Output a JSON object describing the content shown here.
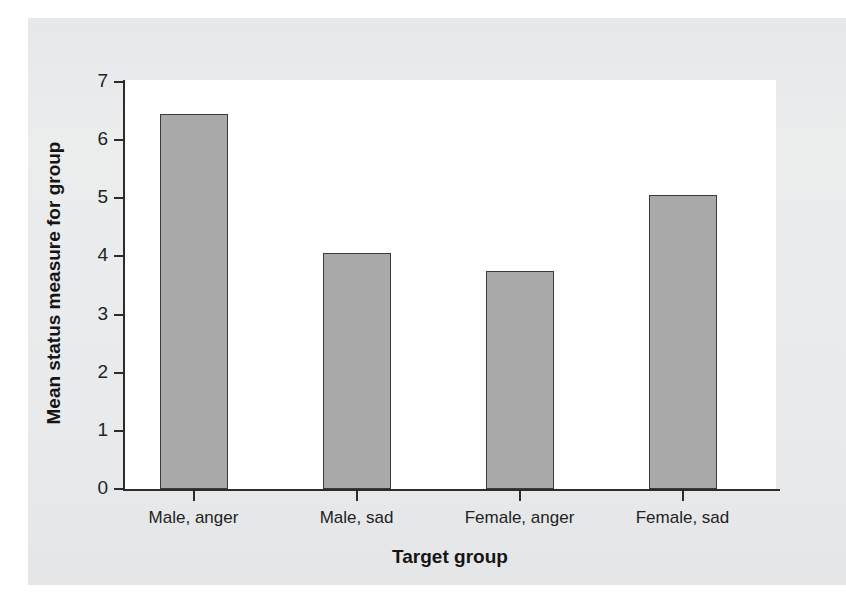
{
  "figure": {
    "background_color": "#e9eaec",
    "plot_background_color": "#ffffff",
    "bar_fill_color": "#a9a9a9",
    "bar_edge_color": "#3a3a3a",
    "axis_color": "#2c2c2c"
  },
  "chart_data": {
    "type": "bar",
    "title": "",
    "xlabel": "Target group",
    "ylabel": "Mean status measure for group",
    "categories": [
      "Male, anger",
      "Male, sad",
      "Female, anger",
      "Female, sad"
    ],
    "values": [
      6.45,
      4.06,
      3.75,
      5.06
    ],
    "ylim": [
      0,
      7
    ],
    "yticks": [
      "0",
      "1",
      "2",
      "3",
      "4",
      "5",
      "6",
      "7"
    ],
    "ytick_values": [
      0,
      1,
      2,
      3,
      4,
      5,
      6,
      7
    ],
    "grid": false,
    "legend": false,
    "legend_position": "none"
  }
}
